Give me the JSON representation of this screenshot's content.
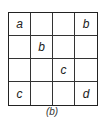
{
  "diagram": {
    "rows": 4,
    "cols": 4,
    "cells": [
      [
        "a",
        "",
        "",
        "b"
      ],
      [
        "",
        "b",
        "",
        ""
      ],
      [
        "",
        "",
        "c",
        ""
      ],
      [
        "c",
        "",
        "",
        "d"
      ]
    ]
  },
  "caption": "(b)"
}
